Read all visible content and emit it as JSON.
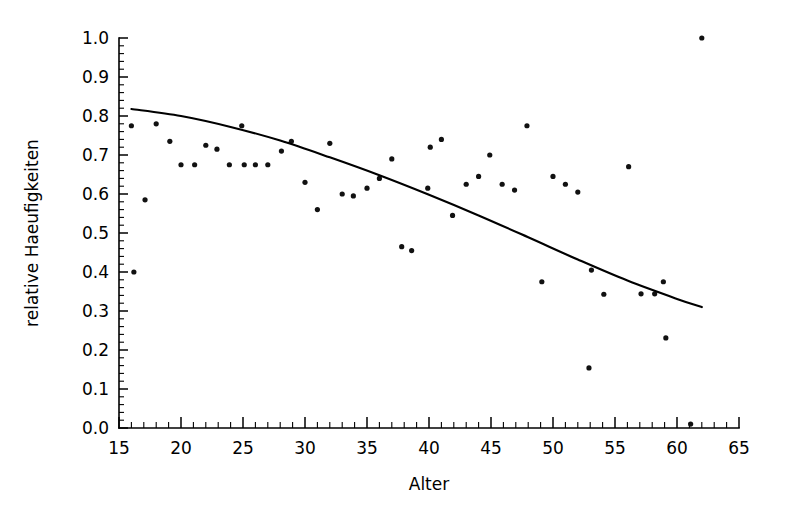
{
  "chart_data": {
    "type": "scatter",
    "title": "",
    "subtitle": "",
    "xlabel": "Alter",
    "ylabel": "relative Haeufigkeiten",
    "xlim": [
      15,
      65
    ],
    "ylim": [
      0.0,
      1.0
    ],
    "grid": false,
    "legend": null,
    "x_major_ticks": [
      15,
      20,
      25,
      30,
      35,
      40,
      45,
      50,
      55,
      60,
      65
    ],
    "x_major_tick_labels": [
      "15",
      "20",
      "25",
      "30",
      "35",
      "40",
      "45",
      "50",
      "55",
      "60",
      "65"
    ],
    "x_minor_tick_step": 1,
    "y_major_ticks": [
      0.0,
      0.1,
      0.2,
      0.3,
      0.4,
      0.5,
      0.6,
      0.7,
      0.8,
      0.9,
      1.0
    ],
    "y_major_tick_labels": [
      "0.0",
      "0.1",
      "0.2",
      "0.3",
      "0.4",
      "0.5",
      "0.6",
      "0.7",
      "0.8",
      "0.9",
      "1.0"
    ],
    "y_minor_tick_step": 0.02,
    "marker": "dot",
    "marker_color": "#111111",
    "series": [
      {
        "name": "relative Haeufigkeit nach Alter",
        "type": "scatter",
        "points": [
          [
            16.2,
            0.4
          ],
          [
            16.0,
            0.775
          ],
          [
            17.1,
            0.585
          ],
          [
            18.0,
            0.78
          ],
          [
            19.1,
            0.735
          ],
          [
            20.0,
            0.675
          ],
          [
            21.1,
            0.675
          ],
          [
            22.0,
            0.725
          ],
          [
            22.9,
            0.715
          ],
          [
            23.9,
            0.675
          ],
          [
            24.9,
            0.775
          ],
          [
            25.1,
            0.675
          ],
          [
            26.0,
            0.675
          ],
          [
            27.0,
            0.675
          ],
          [
            28.1,
            0.71
          ],
          [
            28.9,
            0.735
          ],
          [
            30.0,
            0.63
          ],
          [
            31.0,
            0.56
          ],
          [
            32.0,
            0.73
          ],
          [
            33.0,
            0.6
          ],
          [
            33.9,
            0.595
          ],
          [
            35.0,
            0.615
          ],
          [
            36.0,
            0.64
          ],
          [
            37.0,
            0.69
          ],
          [
            37.8,
            0.465
          ],
          [
            38.6,
            0.455
          ],
          [
            39.9,
            0.615
          ],
          [
            40.1,
            0.72
          ],
          [
            41.0,
            0.74
          ],
          [
            41.9,
            0.545
          ],
          [
            43.0,
            0.625
          ],
          [
            44.0,
            0.645
          ],
          [
            44.9,
            0.7
          ],
          [
            45.9,
            0.625
          ],
          [
            46.9,
            0.61
          ],
          [
            47.9,
            0.775
          ],
          [
            49.1,
            0.375
          ],
          [
            50.0,
            0.645
          ],
          [
            51.0,
            0.625
          ],
          [
            52.0,
            0.605
          ],
          [
            52.9,
            0.154
          ],
          [
            53.1,
            0.405
          ],
          [
            54.1,
            0.343
          ],
          [
            56.1,
            0.67
          ],
          [
            57.1,
            0.344
          ],
          [
            58.2,
            0.344
          ],
          [
            58.9,
            0.375
          ],
          [
            59.1,
            0.231
          ],
          [
            61.1,
            0.01
          ],
          [
            62.0,
            1.0
          ]
        ]
      },
      {
        "name": "Ausgleichskurve",
        "type": "line",
        "points": [
          [
            16.0,
            0.818
          ],
          [
            20.0,
            0.8
          ],
          [
            24.0,
            0.772
          ],
          [
            28.0,
            0.737
          ],
          [
            32.0,
            0.694
          ],
          [
            36.0,
            0.648
          ],
          [
            40.0,
            0.598
          ],
          [
            44.0,
            0.545
          ],
          [
            48.0,
            0.489
          ],
          [
            52.0,
            0.432
          ],
          [
            56.0,
            0.378
          ],
          [
            60.0,
            0.331
          ],
          [
            62.0,
            0.31
          ]
        ]
      }
    ]
  },
  "axes": {
    "x_title": "Alter",
    "y_title": "relative Haeufigkeiten"
  }
}
